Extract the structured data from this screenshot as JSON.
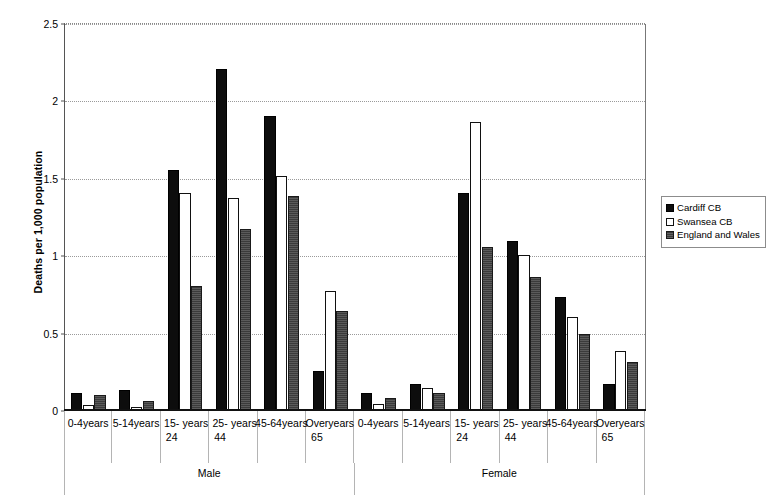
{
  "chart_data": {
    "type": "bar",
    "title": "",
    "subtitle": "",
    "xlabel": "",
    "ylabel": "Deaths per 1,000 population",
    "ylim": [
      0,
      2.5
    ],
    "yticks": [
      0,
      0.5,
      1,
      1.5,
      2,
      2.5
    ],
    "ytick_labels": [
      "0",
      "0.5",
      "1",
      "1.5",
      "2",
      "2.5"
    ],
    "grid": true,
    "legend_position": "right",
    "group_labels": [
      "Male",
      "Female"
    ],
    "categories": [
      "0-4years",
      "5-14 years",
      "15-24 years",
      "25-44 years",
      "45-64years",
      "Over 65 years",
      "0-4years",
      "5-14 years",
      "15-24 years",
      "25-44 years",
      "45-64years",
      "Over 65 years"
    ],
    "category_lines": [
      [
        "0-4years"
      ],
      [
        "5-14",
        "years"
      ],
      [
        "15-24",
        "years"
      ],
      [
        "25-44",
        "years"
      ],
      [
        "45-",
        "64years"
      ],
      [
        "Over 65",
        "years"
      ],
      [
        "0-4years"
      ],
      [
        "5-14",
        "years"
      ],
      [
        "15-24",
        "years"
      ],
      [
        "25-44",
        "years"
      ],
      [
        "45-",
        "64years"
      ],
      [
        "Over 65",
        "years"
      ]
    ],
    "series": [
      {
        "name": "Cardiff CB",
        "color": "#0d0d0d",
        "values": [
          0.11,
          0.13,
          1.55,
          2.2,
          1.9,
          0.25,
          0.11,
          0.17,
          1.4,
          1.09,
          0.73,
          0.17
        ]
      },
      {
        "name": "Swansea CB",
        "color": "#ffffff",
        "values": [
          0.03,
          0.02,
          1.4,
          1.37,
          1.51,
          0.77,
          0.04,
          0.14,
          1.86,
          1.0,
          0.6,
          0.38
        ]
      },
      {
        "name": "England and Wales",
        "color": "#3b3b3b",
        "values": [
          0.1,
          0.06,
          0.8,
          1.17,
          1.38,
          0.64,
          0.08,
          0.11,
          1.05,
          0.86,
          0.49,
          0.31
        ]
      }
    ]
  },
  "legend": {
    "items": [
      {
        "label": "Cardiff CB"
      },
      {
        "label": "Swansea CB"
      },
      {
        "label": "England and Wales"
      }
    ]
  }
}
